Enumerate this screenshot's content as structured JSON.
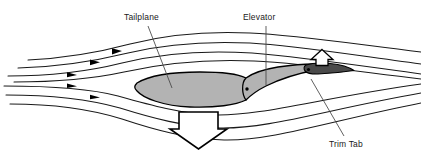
{
  "diagram": {
    "background_color": "#ffffff",
    "labels": {
      "tailplane": "Tailplane",
      "elevator": "Elevator",
      "trim_tab": "Trim Tab"
    },
    "colors": {
      "outline": "#000000",
      "tailplane_fill": "#b3b3b3",
      "elevator_fill": "#b3b3b3",
      "trim_tab_fill": "#4a4a4a",
      "streamline": "#1a1a1a",
      "arrow_fill": "#ffffff",
      "arrow_outline": "#000000",
      "flow_arrowhead": "#000000",
      "leader_line": "#444444",
      "hinge_dot": "#000000",
      "label_text": "#1a1a1a"
    },
    "components": {
      "tailplane_name": "tailplane-body",
      "elevator_name": "elevator-surface",
      "trim_tab_name": "trim-tab-surface",
      "hinge_main_name": "elevator-hinge-point",
      "hinge_tab_name": "trim-tab-hinge-point"
    },
    "force_arrows": [
      {
        "name": "trim-tab-up-force-arrow",
        "direction": "up",
        "size": "small",
        "x": 322,
        "y": 60,
        "meaning": "trim tab aerodynamic force up"
      },
      {
        "name": "elevator-down-force-arrow",
        "direction": "down",
        "size": "large",
        "x": 198,
        "y": 128,
        "meaning": "resulting tailplane force down"
      }
    ],
    "streamlines": {
      "count": 6,
      "flow_direction": "left-to-right",
      "arrowhead_count": 5,
      "arrowhead_positions_x": [
        118,
        96,
        73,
        73,
        96
      ]
    },
    "leaders": [
      {
        "name": "tailplane-leader-line",
        "from": [
          148,
          26
        ],
        "to": [
          172,
          88
        ]
      },
      {
        "name": "elevator-leader-line",
        "from": [
          266,
          26
        ],
        "to": [
          266,
          85
        ]
      },
      {
        "name": "trim-tab-leader-line",
        "from": [
          344,
          136
        ],
        "to": [
          311,
          79
        ]
      }
    ]
  }
}
